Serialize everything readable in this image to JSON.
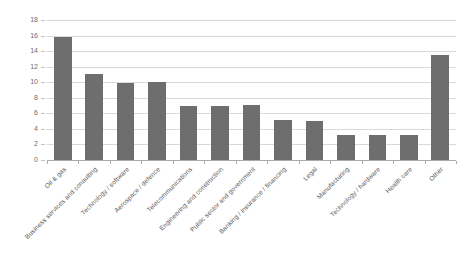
{
  "chart_data": {
    "type": "bar",
    "title": "",
    "subtitle": "",
    "xlabel": "",
    "ylabel": "",
    "ylim": [
      0,
      18
    ],
    "ytick_step": 2,
    "yticks": [
      0,
      2,
      4,
      6,
      8,
      10,
      12,
      14,
      16,
      18
    ],
    "ytick_labels": [
      "0",
      "2",
      "4",
      "6",
      "8",
      "10",
      "12",
      "14",
      "16",
      "18"
    ],
    "grid": true,
    "legend": false,
    "legend_position": "none",
    "bar_color": "#6e6e6e",
    "gridline_color": "#d9d9d9",
    "axis_color": "#aaaaaa",
    "categories": [
      "Oil & gas",
      "Business services and consulting",
      "Technology / software",
      "Aerospace / defence",
      "Telecommunications",
      "Engineering and construction",
      "Public sector and government",
      "Banking / insurance / financing",
      "Legal",
      "Manufacturing",
      "Technology / hardware",
      "Health care",
      "Other"
    ],
    "values": [
      15.8,
      11.0,
      9.9,
      10.0,
      7.0,
      7.0,
      7.1,
      5.1,
      5.0,
      3.2,
      3.2,
      3.2,
      13.5
    ]
  }
}
